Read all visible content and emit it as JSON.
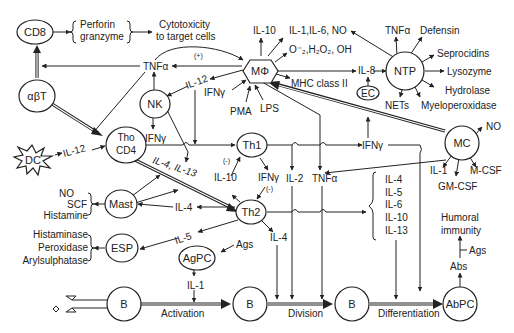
{
  "diagram": {
    "nodes": {
      "cd8": "CD8",
      "abt": "αβT",
      "dc": "DC",
      "tho": "Tho",
      "cd4": "CD4",
      "nk": "NK",
      "mphi": "MΦ",
      "ntp": "NTP",
      "ec": "EC",
      "th1": "Th1",
      "th2": "Th2",
      "mc": "MC",
      "mast": "Mast",
      "esp": "ESP",
      "agpc": "AgPC",
      "b1": "B",
      "b2": "B",
      "b3": "B",
      "abpc": "AbPC"
    },
    "labels": {
      "perforin": "Perforin",
      "granzyme": "granzyme",
      "cytotoxicity_1": "Cytotoxicity",
      "cytotoxicity_2": "to target cells",
      "tnfa_top": "TNFα",
      "plus_top": "(+)",
      "il12_mphi": "IL-12",
      "il12_dc": "IL-12",
      "ifng_nk": "IFNγ",
      "ifng_mphi": "IFNγ",
      "pma": "PMA",
      "lps": "LPS",
      "il10_top": "IL-10",
      "il1_il6_no": "IL-1,IL-6, NO",
      "ros": "O⁻₂,H₂O₂, OH",
      "mhc2": "MHC class II",
      "il8": "IL-8",
      "ntp_tnfa": "TNFα",
      "defensin": "Defensin",
      "seprocidins": "Seprocidins",
      "lysozyme": "Lysozyme",
      "hydrolase": "Hydrolase",
      "myeloperoxidase": "Myeloperoxidase",
      "nets": "NETs",
      "il4_il13": "IL-4, IL-13",
      "minus_th1": "(-)",
      "il10_mid": "IL-10",
      "ifng_th1": "IFNγ",
      "minus_th2": "(-)",
      "il2": "IL-2",
      "tnfa_mid": "TNFα",
      "ifng_right": "IFNγ",
      "mc_no": "NO",
      "mc_il1": "IL-1",
      "gmcsf": "GM-CSF",
      "mcsf": "M-CSF",
      "mast_no": "NO",
      "scf": "SCF",
      "histamine": "Histamine",
      "il4_mast": "IL-4",
      "il5": "IL-5",
      "histaminase": "Histaminase",
      "peroxidase": "Peroxidase",
      "arylsulphatase": "Arylsulphatase",
      "ags_agpc": "Ags",
      "il1_agpc": "IL-1",
      "il4_th2_down": "IL-4",
      "cyto_list": [
        "IL-4",
        "IL-5",
        "IL-6",
        "IL-10",
        "IL-13"
      ],
      "humoral_1": "Humoral",
      "humoral_2": "immunity",
      "ags_abs": "Ags",
      "abs": "Abs",
      "activation": "Activation",
      "division": "Division",
      "differentiation": "Differentiation"
    }
  }
}
